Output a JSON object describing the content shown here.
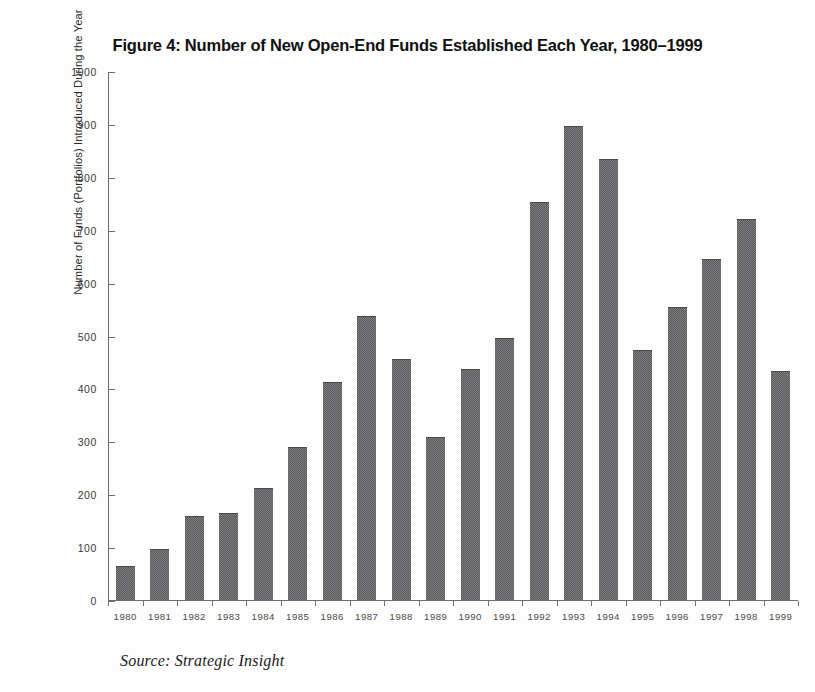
{
  "chart_data": {
    "type": "bar",
    "title": "Figure 4: Number of New Open-End Funds Established Each Year, 1980–1999",
    "xlabel": "",
    "ylabel": "Number of Funds (Portfolios) Introduced During the Year",
    "ylim": [
      0,
      1000
    ],
    "ytick_step": 100,
    "grid": false,
    "legend": null,
    "bar_color": "#5a5a5c",
    "categories": [
      "1980",
      "1981",
      "1982",
      "1983",
      "1984",
      "1985",
      "1986",
      "1987",
      "1988",
      "1989",
      "1990",
      "1991",
      "1992",
      "1993",
      "1994",
      "1995",
      "1996",
      "1997",
      "1998",
      "1999"
    ],
    "values": [
      62,
      94,
      158,
      163,
      211,
      288,
      411,
      536,
      455,
      307,
      435,
      495,
      751,
      896,
      834,
      472,
      553,
      644,
      719,
      431
    ],
    "ytick_labels": [
      "0",
      "100",
      "200",
      "300",
      "400",
      "500",
      "600",
      "700",
      "800",
      "900",
      "1000"
    ],
    "source_note": "Source: Strategic Insight"
  }
}
